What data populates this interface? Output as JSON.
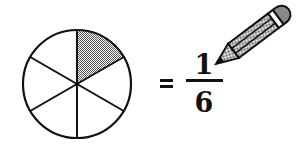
{
  "figure": {
    "circle": {
      "sectors": 6,
      "shaded_sectors": 1,
      "shade_color": "#9a9a9a",
      "stroke_color": "#111111"
    },
    "equation": {
      "equals_sign": "=",
      "numerator": "1",
      "denominator": "6"
    },
    "decoration": {
      "icon": "pencil-icon"
    }
  }
}
